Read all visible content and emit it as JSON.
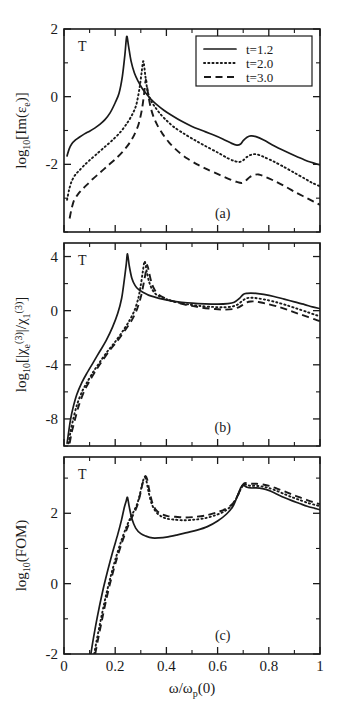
{
  "figure": {
    "xlabel": "ω/ω",
    "xlabel_sub": "p",
    "xlabel_tail": "(0)",
    "xticks": [
      "0",
      "0.2",
      "0.4",
      "0.6",
      "0.8",
      "1"
    ],
    "xtick_values": [
      0,
      0.2,
      0.4,
      0.6,
      0.8,
      1
    ],
    "xlim": [
      0,
      1
    ],
    "marker_label": "T"
  },
  "legend": {
    "position": "top-right of panel (a)",
    "entries": [
      {
        "label": "t=1.2",
        "style": "solid"
      },
      {
        "label": "t=2.0",
        "style": "dotted"
      },
      {
        "label": "t=3.0",
        "style": "dashed"
      }
    ]
  },
  "chart_data": [
    {
      "type": "line",
      "panel": "(a)",
      "title": "",
      "xlabel": "ω/ω_p(0)",
      "ylabel": "log10[Im(ε_e)]",
      "ylabel_parts": {
        "base": "log",
        "base_sub": "10",
        "arg": "[Im(ε",
        "arg_sub": "e",
        "arg_tail": ")]"
      },
      "xlim": [
        0,
        1
      ],
      "ylim": [
        -4,
        2
      ],
      "yticks": [
        "2",
        "0",
        "-2"
      ],
      "ytick_values": [
        2,
        0,
        -2
      ],
      "grid": false,
      "series": [
        {
          "name": "t=1.2",
          "style": "solid",
          "x": [
            0.012,
            0.02,
            0.03,
            0.045,
            0.06,
            0.08,
            0.1,
            0.12,
            0.14,
            0.16,
            0.18,
            0.2,
            0.215,
            0.228,
            0.238,
            0.245,
            0.252,
            0.262,
            0.275,
            0.29,
            0.305,
            0.32,
            0.34,
            0.36,
            0.39,
            0.42,
            0.46,
            0.5,
            0.54,
            0.58,
            0.62,
            0.655,
            0.675,
            0.69,
            0.7,
            0.715,
            0.73,
            0.75,
            0.78,
            0.82,
            0.86,
            0.9,
            0.94,
            0.97,
            1.0
          ],
          "y": [
            -1.75,
            -1.55,
            -1.4,
            -1.28,
            -1.2,
            -1.1,
            -1.02,
            -0.93,
            -0.82,
            -0.68,
            -0.48,
            -0.18,
            0.1,
            0.6,
            1.25,
            1.78,
            1.5,
            1.05,
            0.7,
            0.45,
            0.25,
            0.1,
            -0.08,
            -0.22,
            -0.4,
            -0.55,
            -0.73,
            -0.88,
            -1.0,
            -1.12,
            -1.25,
            -1.38,
            -1.43,
            -1.4,
            -1.3,
            -1.2,
            -1.16,
            -1.18,
            -1.28,
            -1.45,
            -1.6,
            -1.74,
            -1.87,
            -1.95,
            -2.02
          ]
        },
        {
          "name": "t=2.0",
          "style": "dotted",
          "x": [
            0.012,
            0.02,
            0.03,
            0.045,
            0.06,
            0.08,
            0.1,
            0.13,
            0.16,
            0.19,
            0.22,
            0.245,
            0.265,
            0.282,
            0.295,
            0.303,
            0.31,
            0.318,
            0.327,
            0.34,
            0.355,
            0.375,
            0.4,
            0.43,
            0.47,
            0.51,
            0.55,
            0.6,
            0.64,
            0.665,
            0.685,
            0.7,
            0.715,
            0.73,
            0.75,
            0.78,
            0.82,
            0.86,
            0.9,
            0.94,
            0.97,
            1.0
          ],
          "y": [
            -3.05,
            -2.75,
            -2.5,
            -2.3,
            -2.18,
            -2.02,
            -1.88,
            -1.68,
            -1.48,
            -1.28,
            -1.05,
            -0.8,
            -0.55,
            -0.25,
            0.25,
            0.7,
            1.05,
            0.6,
            0.15,
            -0.12,
            -0.3,
            -0.5,
            -0.7,
            -0.9,
            -1.1,
            -1.28,
            -1.45,
            -1.65,
            -1.82,
            -1.9,
            -1.93,
            -1.88,
            -1.78,
            -1.72,
            -1.7,
            -1.78,
            -1.92,
            -2.08,
            -2.25,
            -2.42,
            -2.55,
            -2.65
          ]
        },
        {
          "name": "t=3.0",
          "style": "dashed",
          "x": [
            0.022,
            0.03,
            0.04,
            0.055,
            0.07,
            0.09,
            0.11,
            0.14,
            0.17,
            0.2,
            0.23,
            0.255,
            0.275,
            0.292,
            0.305,
            0.313,
            0.32,
            0.328,
            0.338,
            0.35,
            0.365,
            0.385,
            0.41,
            0.44,
            0.48,
            0.52,
            0.56,
            0.61,
            0.65,
            0.675,
            0.695,
            0.71,
            0.725,
            0.74,
            0.76,
            0.79,
            0.83,
            0.87,
            0.91,
            0.95,
            0.98,
            1.0
          ],
          "y": [
            -3.6,
            -3.3,
            -3.05,
            -2.88,
            -2.75,
            -2.6,
            -2.45,
            -2.25,
            -2.05,
            -1.85,
            -1.62,
            -1.38,
            -1.12,
            -0.8,
            -0.35,
            0.1,
            0.5,
            0.1,
            -0.3,
            -0.6,
            -0.85,
            -1.1,
            -1.35,
            -1.58,
            -1.82,
            -2.0,
            -2.15,
            -2.32,
            -2.45,
            -2.52,
            -2.55,
            -2.48,
            -2.38,
            -2.32,
            -2.3,
            -2.38,
            -2.52,
            -2.68,
            -2.85,
            -3.0,
            -3.12,
            -3.2
          ]
        }
      ]
    },
    {
      "type": "line",
      "panel": "(b)",
      "title": "",
      "xlabel": "ω/ω_p(0)",
      "ylabel": "log10[|χ_e^(3)|/χ_1^(3)]",
      "ylabel_parts": {
        "base": "log",
        "base_sub": "10",
        "arg": "[|χ",
        "arg_sub": "e",
        "arg_sup": "(3)",
        "mid": "|/χ",
        "mid_sub": "1",
        "mid_sup": "(3)",
        "tail": "]"
      },
      "xlim": [
        0,
        1
      ],
      "ylim": [
        -10,
        5
      ],
      "yticks": [
        "4",
        "0",
        "-4",
        "-8"
      ],
      "ytick_values": [
        4,
        0,
        -4,
        -8
      ],
      "grid": false,
      "series": [
        {
          "name": "t=1.2",
          "style": "solid",
          "x": [
            0.012,
            0.018,
            0.025,
            0.035,
            0.05,
            0.07,
            0.09,
            0.115,
            0.14,
            0.165,
            0.19,
            0.21,
            0.225,
            0.235,
            0.243,
            0.248,
            0.255,
            0.265,
            0.278,
            0.292,
            0.31,
            0.33,
            0.355,
            0.385,
            0.42,
            0.46,
            0.5,
            0.55,
            0.6,
            0.64,
            0.665,
            0.685,
            0.7,
            0.715,
            0.73,
            0.75,
            0.78,
            0.82,
            0.86,
            0.9,
            0.94,
            0.97,
            1.0
          ],
          "y": [
            -9.8,
            -9.0,
            -8.1,
            -7.2,
            -6.2,
            -5.3,
            -4.6,
            -3.8,
            -3.0,
            -2.2,
            -1.2,
            -0.2,
            0.9,
            2.2,
            3.4,
            4.2,
            3.3,
            2.4,
            1.85,
            1.55,
            1.35,
            1.15,
            1.0,
            0.85,
            0.72,
            0.62,
            0.55,
            0.5,
            0.48,
            0.52,
            0.62,
            0.9,
            1.2,
            1.28,
            1.3,
            1.28,
            1.2,
            1.05,
            0.85,
            0.65,
            0.45,
            0.28,
            0.15
          ]
        },
        {
          "name": "t=2.0",
          "style": "dotted",
          "x": [
            0.018,
            0.025,
            0.035,
            0.05,
            0.07,
            0.09,
            0.115,
            0.14,
            0.17,
            0.2,
            0.23,
            0.255,
            0.275,
            0.29,
            0.3,
            0.308,
            0.315,
            0.323,
            0.333,
            0.345,
            0.36,
            0.385,
            0.415,
            0.45,
            0.49,
            0.53,
            0.58,
            0.62,
            0.655,
            0.678,
            0.695,
            0.71,
            0.725,
            0.74,
            0.76,
            0.79,
            0.83,
            0.87,
            0.91,
            0.95,
            0.98,
            1.0
          ],
          "y": [
            -9.8,
            -9.0,
            -8.1,
            -7.0,
            -6.0,
            -5.3,
            -4.5,
            -3.8,
            -3.0,
            -2.3,
            -1.5,
            -0.75,
            0.0,
            0.9,
            1.9,
            2.9,
            3.65,
            2.9,
            2.1,
            1.55,
            1.2,
            0.95,
            0.75,
            0.58,
            0.45,
            0.35,
            0.28,
            0.25,
            0.3,
            0.45,
            0.7,
            0.9,
            0.95,
            0.95,
            0.9,
            0.8,
            0.62,
            0.4,
            0.15,
            -0.1,
            -0.3,
            -0.42
          ]
        },
        {
          "name": "t=3.0",
          "style": "dashed",
          "x": [
            0.022,
            0.03,
            0.042,
            0.058,
            0.08,
            0.1,
            0.125,
            0.15,
            0.18,
            0.21,
            0.24,
            0.265,
            0.285,
            0.3,
            0.31,
            0.318,
            0.325,
            0.333,
            0.343,
            0.355,
            0.37,
            0.395,
            0.425,
            0.46,
            0.5,
            0.54,
            0.59,
            0.63,
            0.66,
            0.682,
            0.7,
            0.715,
            0.73,
            0.745,
            0.765,
            0.795,
            0.835,
            0.875,
            0.915,
            0.955,
            0.98,
            1.0
          ],
          "y": [
            -9.8,
            -9.0,
            -8.1,
            -7.0,
            -5.9,
            -5.2,
            -4.4,
            -3.7,
            -2.9,
            -2.2,
            -1.4,
            -0.7,
            0.1,
            1.0,
            1.9,
            2.7,
            3.38,
            2.75,
            2.0,
            1.5,
            1.18,
            0.92,
            0.7,
            0.5,
            0.35,
            0.22,
            0.12,
            0.08,
            0.12,
            0.25,
            0.45,
            0.62,
            0.68,
            0.68,
            0.62,
            0.5,
            0.3,
            0.05,
            -0.22,
            -0.48,
            -0.65,
            -0.78
          ]
        }
      ]
    },
    {
      "type": "line",
      "panel": "(c)",
      "title": "",
      "xlabel": "ω/ω_p(0)",
      "ylabel": "log10(FOM)",
      "ylabel_parts": {
        "base": "log",
        "base_sub": "10",
        "arg": "(FOM)"
      },
      "xlim": [
        0,
        1
      ],
      "ylim": [
        -2,
        3.6
      ],
      "yticks": [
        "2",
        "0",
        "-2"
      ],
      "ytick_values": [
        2,
        0,
        -2
      ],
      "grid": false,
      "series": [
        {
          "name": "t=1.2",
          "style": "solid",
          "x": [
            0.105,
            0.115,
            0.13,
            0.15,
            0.17,
            0.19,
            0.21,
            0.225,
            0.235,
            0.243,
            0.248,
            0.255,
            0.265,
            0.28,
            0.3,
            0.32,
            0.345,
            0.37,
            0.4,
            0.44,
            0.48,
            0.52,
            0.56,
            0.6,
            0.635,
            0.66,
            0.678,
            0.69,
            0.698,
            0.705,
            0.715,
            0.73,
            0.75,
            0.775,
            0.8,
            0.83,
            0.86,
            0.89,
            0.92,
            0.95,
            0.98,
            1.0
          ],
          "y": [
            -2.0,
            -1.55,
            -0.95,
            -0.25,
            0.35,
            0.9,
            1.4,
            1.82,
            2.15,
            2.35,
            2.45,
            2.18,
            1.85,
            1.58,
            1.42,
            1.35,
            1.3,
            1.3,
            1.32,
            1.38,
            1.45,
            1.52,
            1.62,
            1.78,
            1.98,
            2.2,
            2.5,
            2.72,
            2.8,
            2.78,
            2.74,
            2.72,
            2.72,
            2.7,
            2.65,
            2.55,
            2.45,
            2.36,
            2.28,
            2.2,
            2.14,
            2.1
          ]
        },
        {
          "name": "t=2.0",
          "style": "dotted",
          "x": [
            0.118,
            0.128,
            0.143,
            0.162,
            0.182,
            0.202,
            0.222,
            0.242,
            0.258,
            0.272,
            0.285,
            0.295,
            0.303,
            0.31,
            0.316,
            0.322,
            0.33,
            0.342,
            0.358,
            0.378,
            0.4,
            0.43,
            0.47,
            0.51,
            0.55,
            0.59,
            0.625,
            0.655,
            0.675,
            0.69,
            0.698,
            0.706,
            0.716,
            0.73,
            0.75,
            0.775,
            0.8,
            0.83,
            0.86,
            0.89,
            0.92,
            0.95,
            0.98,
            1.0
          ],
          "y": [
            -2.0,
            -1.6,
            -1.05,
            -0.4,
            0.2,
            0.72,
            1.18,
            1.58,
            1.85,
            2.05,
            2.25,
            2.5,
            2.75,
            2.95,
            3.02,
            2.92,
            2.62,
            2.28,
            2.05,
            1.92,
            1.85,
            1.82,
            1.8,
            1.82,
            1.86,
            1.94,
            2.05,
            2.22,
            2.45,
            2.68,
            2.78,
            2.82,
            2.8,
            2.78,
            2.78,
            2.76,
            2.72,
            2.64,
            2.55,
            2.46,
            2.38,
            2.3,
            2.24,
            2.2
          ]
        },
        {
          "name": "t=3.0",
          "style": "dashed",
          "x": [
            0.122,
            0.132,
            0.147,
            0.166,
            0.186,
            0.206,
            0.226,
            0.246,
            0.262,
            0.276,
            0.288,
            0.298,
            0.306,
            0.313,
            0.319,
            0.325,
            0.333,
            0.345,
            0.361,
            0.381,
            0.405,
            0.435,
            0.475,
            0.515,
            0.555,
            0.595,
            0.63,
            0.66,
            0.678,
            0.692,
            0.7,
            0.708,
            0.718,
            0.732,
            0.752,
            0.777,
            0.802,
            0.832,
            0.862,
            0.892,
            0.922,
            0.952,
            0.98,
            1.0
          ],
          "y": [
            -2.0,
            -1.62,
            -1.08,
            -0.42,
            0.18,
            0.7,
            1.16,
            1.56,
            1.84,
            2.04,
            2.26,
            2.55,
            2.82,
            3.0,
            3.06,
            2.96,
            2.66,
            2.3,
            2.08,
            1.98,
            1.92,
            1.9,
            1.88,
            1.9,
            1.94,
            2.02,
            2.12,
            2.28,
            2.5,
            2.72,
            2.82,
            2.86,
            2.84,
            2.84,
            2.84,
            2.82,
            2.78,
            2.7,
            2.62,
            2.53,
            2.45,
            2.37,
            2.3,
            2.26
          ]
        }
      ]
    }
  ]
}
